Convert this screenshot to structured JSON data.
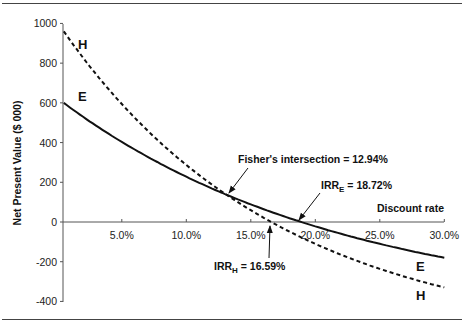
{
  "chart_data": {
    "type": "line",
    "title": "",
    "xlabel": "Discount rate",
    "ylabel": "Net Present Value ($ 000)",
    "xlim": [
      0,
      30
    ],
    "ylim": [
      -400,
      1000
    ],
    "grid": false,
    "x_ticks": [
      "5.0%",
      "10.0%",
      "15.0%",
      "20.0%",
      "25.0%",
      "30.0%"
    ],
    "y_ticks": [
      "1000",
      "800",
      "600",
      "400",
      "200",
      "0",
      "-200",
      "-400"
    ],
    "x": [
      0.5,
      5,
      10,
      12.94,
      15,
      16.59,
      18.72,
      20,
      25,
      30
    ],
    "series": [
      {
        "name": "E",
        "style": "solid",
        "values": [
          600,
          403,
          228,
          142,
          89,
          22,
          0,
          -22,
          -110,
          -180
        ]
      },
      {
        "name": "H",
        "style": "dashed",
        "values": [
          960,
          594,
          287,
          145,
          59,
          0,
          -73,
          -110,
          -236,
          -330
        ]
      }
    ],
    "annotations": [
      {
        "text": "Fisher's intersection = 12.94%",
        "x": 12.94,
        "y": 143
      },
      {
        "text": "IRR_E = 18.72%",
        "x": 18.72,
        "y": 0
      },
      {
        "text": "IRR_H = 16.59%",
        "x": 16.59,
        "y": 0
      }
    ],
    "legend": "inline labels at curve ends"
  },
  "labels": {
    "ylabel": "Net Present Value ($ 000)",
    "xlabel": "Discount rate",
    "fisher": "Fisher's intersection = 12.94%",
    "irr_e_main": "IRR",
    "irr_e_sub": "E",
    "irr_e_val": " = 18.72%",
    "irr_h_main": "IRR",
    "irr_h_sub": "H",
    "irr_h_val": " = 16.59%",
    "series_e": "E",
    "series_h": "H"
  }
}
